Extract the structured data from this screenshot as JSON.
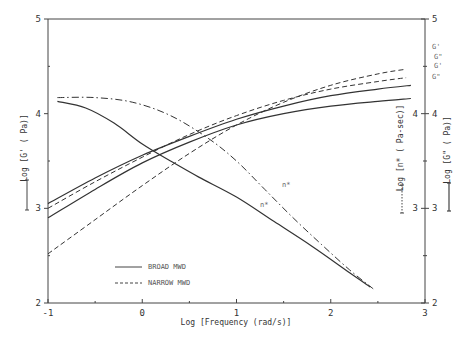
{
  "chart_data": {
    "type": "line",
    "title": "",
    "xlabel": "Log [Frequency (rad/s)]",
    "ylabel_left": "Log [G' ( Pa)]",
    "ylabel_right_inner": "Log [n* ( Pa-sec)]",
    "ylabel_right_outer": "Log [G\" ( Pa)]",
    "xlim": [
      -1,
      3
    ],
    "ylim": [
      2,
      5
    ],
    "x_ticks": [
      "-1",
      "0",
      "1",
      "2",
      "3"
    ],
    "y_ticks_left": [
      "2",
      "3",
      "4",
      "5"
    ],
    "y_ticks_right_inner": [
      "3",
      "4"
    ],
    "y_ticks_right_outer": [
      "2",
      "3",
      "4",
      "5"
    ],
    "grid": false,
    "legend": {
      "position": "lower-left inside",
      "entries": [
        {
          "label": "BROAD MWD",
          "style": "solid"
        },
        {
          "label": "NARROW MWD",
          "style": "dashed"
        }
      ]
    },
    "series": [
      {
        "name": "G' (Broad MWD)",
        "label": "G'",
        "style": "solid",
        "x": [
          -1.0,
          -0.5,
          0.0,
          0.5,
          1.0,
          1.5,
          2.0,
          2.5,
          2.85
        ],
        "y": [
          3.05,
          3.32,
          3.56,
          3.76,
          3.94,
          4.08,
          4.19,
          4.26,
          4.3
        ]
      },
      {
        "name": "G\" (Broad MWD)",
        "label": "G\"",
        "style": "solid",
        "x": [
          -1.0,
          -0.5,
          0.0,
          0.5,
          1.0,
          1.5,
          2.0,
          2.5,
          2.85
        ],
        "y": [
          2.9,
          3.2,
          3.48,
          3.7,
          3.88,
          4.0,
          4.08,
          4.13,
          4.16
        ]
      },
      {
        "name": "G' (Narrow MWD)",
        "label": "G'",
        "style": "dashed",
        "x": [
          -1.0,
          -0.5,
          0.0,
          0.5,
          1.0,
          1.5,
          2.0,
          2.5,
          2.8
        ],
        "y": [
          2.52,
          2.88,
          3.24,
          3.58,
          3.88,
          4.12,
          4.3,
          4.42,
          4.47
        ]
      },
      {
        "name": "G\" (Narrow MWD)",
        "label": "G\"",
        "style": "dashed",
        "x": [
          -1.0,
          -0.5,
          0.0,
          0.5,
          1.0,
          1.5,
          2.0,
          2.5,
          2.8
        ],
        "y": [
          3.0,
          3.28,
          3.54,
          3.78,
          3.98,
          4.14,
          4.26,
          4.34,
          4.38
        ]
      },
      {
        "name": "n* (Broad MWD)",
        "label": "n*",
        "style": "solid",
        "x": [
          -0.9,
          -0.6,
          -0.3,
          0.0,
          0.3,
          0.6,
          1.0,
          1.4,
          1.8,
          2.2,
          2.42
        ],
        "y": [
          4.13,
          4.06,
          3.9,
          3.68,
          3.5,
          3.33,
          3.12,
          2.86,
          2.6,
          2.32,
          2.17
        ]
      },
      {
        "name": "n* (Narrow MWD)",
        "label": "n*",
        "style": "dash-dot",
        "x": [
          -0.9,
          -0.5,
          -0.1,
          0.3,
          0.7,
          1.0,
          1.3,
          1.6,
          1.9,
          2.2,
          2.45
        ],
        "y": [
          4.17,
          4.17,
          4.12,
          3.98,
          3.74,
          3.5,
          3.2,
          2.9,
          2.62,
          2.35,
          2.15
        ]
      }
    ],
    "annotations": [
      {
        "text": "G'",
        "near": "narrow G' end (top right)"
      },
      {
        "text": "G\"",
        "near": "narrow G\" end"
      },
      {
        "text": "G'",
        "near": "broad G' end"
      },
      {
        "text": "G\"",
        "near": "broad G\" end"
      },
      {
        "text": "n*",
        "near": "narrow n* curve at x~1.75"
      },
      {
        "text": "n*",
        "near": "broad n* curve at x~1.5"
      }
    ],
    "scale_bars": [
      {
        "side": "left",
        "style": "solid"
      },
      {
        "side": "right-inner",
        "style": "dotted"
      },
      {
        "side": "right-outer",
        "style": "solid"
      }
    ]
  },
  "labels": {
    "xlabel": "Log [Frequency (rad/s)]",
    "ylabel_left": "Log [G' ( Pa)]",
    "ylabel_right_inner": "Log [n* ( Pa-sec)]",
    "ylabel_right_outer": "Log [G\" ( Pa)]",
    "legend_broad": "BROAD MWD",
    "legend_narrow": "NARROW MWD",
    "curve_g1_narrow": "G'",
    "curve_g2_narrow": "G\"",
    "curve_g1_broad": "G'",
    "curve_g2_broad": "G\"",
    "curve_eta_narrow": "n*",
    "curve_eta_broad": "n*"
  }
}
